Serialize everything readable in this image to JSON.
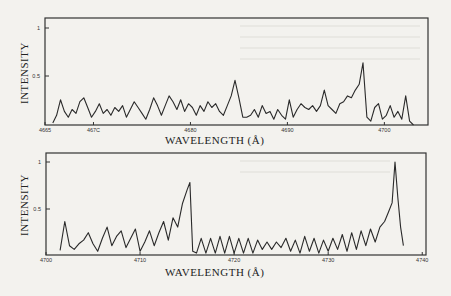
{
  "chart_data": [
    {
      "type": "line",
      "title": "",
      "xlabel": "WAVELENGTH (Å)",
      "ylabel": "INTENSITY",
      "xlim": [
        4665,
        4704.5
      ],
      "ylim": [
        0,
        1.05
      ],
      "xticks": [
        4665,
        4670,
        4680,
        4690,
        4700
      ],
      "xtick_labels": [
        "4665",
        "467C",
        "4680",
        "4690",
        "4700"
      ],
      "yticks": [
        0.5,
        1
      ],
      "ytick_labels": [
        "0.5",
        "1"
      ],
      "grid": false,
      "frame": {
        "left": 45,
        "top": 18,
        "right": 428,
        "bottom": 125
      },
      "y_pixel": {
        "zero": 125,
        "one": 28
      },
      "x": [
        4665.8,
        4666.2,
        4666.6,
        4667.0,
        4667.4,
        4667.8,
        4668.2,
        4668.6,
        4669.0,
        4669.4,
        4669.8,
        4670.2,
        4670.6,
        4671.0,
        4671.4,
        4671.8,
        4672.2,
        4672.6,
        4673.0,
        4673.4,
        4673.8,
        4674.2,
        4674.6,
        4675.0,
        4675.4,
        4675.8,
        4676.2,
        4676.6,
        4677.0,
        4677.4,
        4677.8,
        4678.2,
        4678.6,
        4679.0,
        4679.4,
        4679.8,
        4680.2,
        4680.6,
        4681.0,
        4681.4,
        4681.8,
        4682.2,
        4682.6,
        4683.0,
        4683.4,
        4683.8,
        4684.2,
        4684.6,
        4685.0,
        4685.4,
        4685.8,
        4686.2,
        4686.6,
        4687.0,
        4687.4,
        4687.8,
        4688.2,
        4688.6,
        4689.0,
        4689.4,
        4689.8,
        4690.2,
        4690.6,
        4691.0,
        4691.4,
        4691.8,
        4692.2,
        4692.6,
        4693.0,
        4693.4,
        4693.8,
        4694.2,
        4694.6,
        4695.0,
        4695.4,
        4695.8,
        4696.2,
        4696.6,
        4697.0,
        4697.4,
        4697.8,
        4698.2,
        4698.6,
        4699.0,
        4699.4,
        4699.8,
        4700.2,
        4700.6,
        4701.0,
        4701.4,
        4701.8,
        4702.2,
        4702.6,
        4703.0
      ],
      "values": [
        0.02,
        0.1,
        0.26,
        0.14,
        0.08,
        0.16,
        0.12,
        0.24,
        0.28,
        0.18,
        0.08,
        0.14,
        0.22,
        0.12,
        0.16,
        0.1,
        0.18,
        0.14,
        0.2,
        0.08,
        0.16,
        0.24,
        0.18,
        0.12,
        0.06,
        0.16,
        0.28,
        0.2,
        0.1,
        0.2,
        0.3,
        0.24,
        0.16,
        0.26,
        0.14,
        0.22,
        0.18,
        0.1,
        0.2,
        0.14,
        0.24,
        0.18,
        0.22,
        0.14,
        0.1,
        0.2,
        0.3,
        0.46,
        0.28,
        0.08,
        0.08,
        0.1,
        0.16,
        0.08,
        0.2,
        0.12,
        0.14,
        0.06,
        0.16,
        0.1,
        0.06,
        0.26,
        0.08,
        0.16,
        0.22,
        0.18,
        0.16,
        0.2,
        0.14,
        0.2,
        0.36,
        0.2,
        0.16,
        0.12,
        0.22,
        0.24,
        0.3,
        0.28,
        0.36,
        0.42,
        0.64,
        0.08,
        0.04,
        0.18,
        0.22,
        0.06,
        0.1,
        0.2,
        0.08,
        0.14,
        0.06,
        0.3,
        0.04,
        0.0
      ]
    },
    {
      "type": "line",
      "title": "",
      "xlabel": "WAVELENGTH (Å)",
      "ylabel": "INTENSITY",
      "xlim": [
        4700,
        4740.4
      ],
      "ylim": [
        0,
        1.1
      ],
      "xticks": [
        4700,
        4710,
        4720,
        4730,
        4740
      ],
      "xtick_labels": [
        "4700",
        "4710",
        "4720",
        "4730",
        "4740"
      ],
      "yticks": [
        0.5,
        1
      ],
      "ytick_labels": [
        "0.5",
        "1"
      ],
      "grid": false,
      "frame": {
        "left": 46,
        "top": 153,
        "right": 426,
        "bottom": 255
      },
      "y_pixel": {
        "zero": 255,
        "one": 162
      },
      "x": [
        4701.5,
        4702.0,
        4702.5,
        4703.0,
        4703.5,
        4704.0,
        4704.5,
        4705.0,
        4705.5,
        4706.0,
        4706.5,
        4707.0,
        4707.5,
        4708.0,
        4708.5,
        4709.0,
        4709.5,
        4710.0,
        4710.5,
        4711.0,
        4711.5,
        4712.0,
        4712.5,
        4713.0,
        4713.5,
        4714.0,
        4714.5,
        4715.0,
        4715.3,
        4715.6,
        4716.0,
        4716.5,
        4717.0,
        4717.5,
        4718.0,
        4718.5,
        4719.0,
        4719.5,
        4720.0,
        4720.5,
        4721.0,
        4721.5,
        4722.0,
        4722.5,
        4723.0,
        4723.5,
        4724.0,
        4724.5,
        4725.0,
        4725.5,
        4726.0,
        4726.5,
        4727.0,
        4727.5,
        4728.0,
        4728.5,
        4729.0,
        4729.5,
        4730.0,
        4730.5,
        4731.0,
        4731.5,
        4732.0,
        4732.5,
        4733.0,
        4733.5,
        4734.0,
        4734.5,
        4735.0,
        4735.5,
        4736.0,
        4736.4,
        4736.8,
        4737.1,
        4737.4,
        4737.7,
        4738.0
      ],
      "values": [
        0.05,
        0.36,
        0.1,
        0.06,
        0.12,
        0.16,
        0.24,
        0.12,
        0.04,
        0.18,
        0.3,
        0.1,
        0.2,
        0.26,
        0.08,
        0.18,
        0.28,
        0.04,
        0.14,
        0.26,
        0.1,
        0.24,
        0.36,
        0.16,
        0.4,
        0.3,
        0.55,
        0.7,
        0.78,
        0.04,
        0.02,
        0.18,
        0.02,
        0.18,
        0.02,
        0.2,
        0.02,
        0.2,
        0.02,
        0.18,
        0.02,
        0.18,
        0.02,
        0.16,
        0.06,
        0.14,
        0.06,
        0.14,
        0.08,
        0.18,
        0.04,
        0.16,
        0.02,
        0.2,
        0.04,
        0.18,
        0.02,
        0.16,
        0.04,
        0.18,
        0.06,
        0.22,
        0.04,
        0.24,
        0.06,
        0.26,
        0.1,
        0.28,
        0.14,
        0.3,
        0.36,
        0.46,
        0.56,
        1.0,
        0.62,
        0.3,
        0.1
      ]
    }
  ]
}
